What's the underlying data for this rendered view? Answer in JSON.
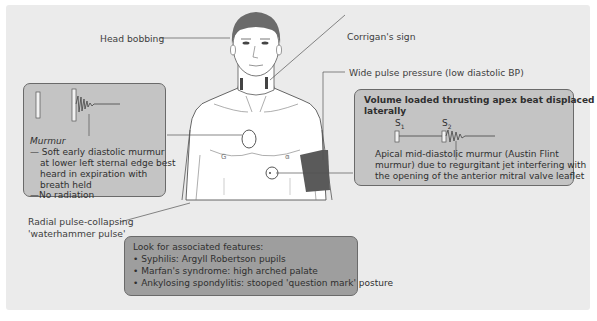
{
  "labels": {
    "head_bobbing": "Head bobbing",
    "corrigans_sign": "Corrigan's sign",
    "wide_pulse_pressure": "Wide pulse pressure (low diastolic BP)",
    "radial_pulse_line1": "Radial pulse-collapsing",
    "radial_pulse_line2": "'waterhammer pulse'"
  },
  "murmur_box": {
    "title": "Murmur",
    "lines": [
      "— Soft early diastolic murmur",
      "at lower left sternal edge best",
      "heard in expiration with",
      "breath held",
      "—No radiation"
    ]
  },
  "apex_box": {
    "title_line1": "Volume loaded thrusting apex beat displaced",
    "title_line2": "laterally",
    "s1_label": "S",
    "s1_sub": "1",
    "s2_label": "S",
    "s2_sub": "2",
    "lines": [
      "Apical mid-diastolic murmur (Austin Flint",
      "murmur) due to regurgitant jet interfering with",
      "the opening of the anterior mitral valve leaflet"
    ]
  },
  "features_box": {
    "title": "Look for associated features:",
    "items": [
      "Syphilis: Argyll Robertson pupils",
      "Marfan's syndrome: high arched palate",
      "Ankylosing spondylitis: stooped 'question mark' posture"
    ],
    "bullet": "•"
  },
  "colors": {
    "panel_bg": "#ebebeb",
    "box_light": "#c4c4c4",
    "box_dark": "#9e9e9e",
    "hair": "#6b6b6b",
    "cuff": "#5a5a5a"
  }
}
